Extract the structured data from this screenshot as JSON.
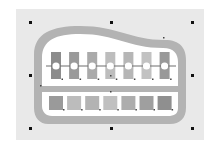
{
  "canvas": {
    "background": "#ffffff",
    "artboard_color": "#e9e9e9",
    "frame_color": "#b3b3b3",
    "inner_color": "#ffffff",
    "divider_color": "#b3b3b3",
    "line_color": "#6e6e6e"
  },
  "bars": [
    {
      "color": "#8c8c8c"
    },
    {
      "color": "#9a9a9a"
    },
    {
      "color": "#aaaaaa"
    },
    {
      "color": "#bdbdbd"
    },
    {
      "color": "#b6b6b6"
    },
    {
      "color": "#c2c2c2"
    },
    {
      "color": "#999999"
    }
  ],
  "squares": [
    {
      "color": "#9a9a9a"
    },
    {
      "color": "#bcbcbc"
    },
    {
      "color": "#b3b3b3"
    },
    {
      "color": "#c0c0c0"
    },
    {
      "color": "#adadad"
    },
    {
      "color": "#9f9f9f"
    },
    {
      "color": "#8f8f8f"
    }
  ],
  "selection": {
    "handles": [
      "top-left",
      "top-center",
      "top-right",
      "middle-left",
      "middle-right",
      "bottom-left",
      "bottom-center",
      "bottom-right"
    ]
  }
}
